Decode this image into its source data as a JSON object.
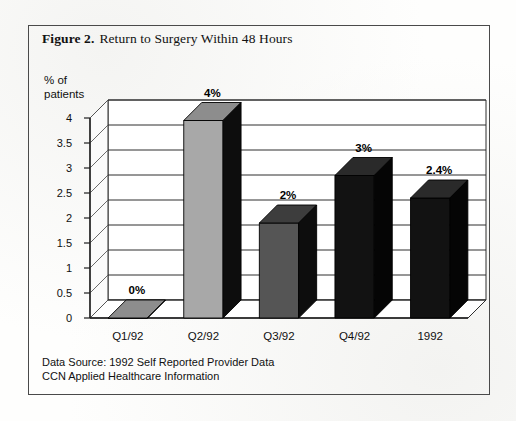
{
  "figure": {
    "caption_label": "Figure 2.",
    "caption_text": "Return to Surgery Within 48 Hours"
  },
  "source_note": "Data Source: 1992 Self Reported Provider Data\nCCN Applied Healthcare Information",
  "axis": {
    "y_title": "% of\npatients"
  },
  "colors": {
    "frame": "#4a4a4a",
    "text": "#111111",
    "gridline": "#2e2e2e",
    "bar_light": "#a8a8a8",
    "bar_mid": "#555555",
    "bar_dark": "#121212",
    "bar_side_dark": "#0d0d0d",
    "bar_top_light": "#8d8d8d",
    "bar_top_dark": "#2a2a2a",
    "plot_background": "#ffffff"
  },
  "chart_data": {
    "type": "bar",
    "title": "Return to Surgery Within 48 Hours",
    "xlabel": "",
    "ylabel": "% of patients",
    "ylim": [
      0,
      4
    ],
    "yticks": [
      0,
      0.5,
      1,
      1.5,
      2,
      2.5,
      3,
      3.5,
      4
    ],
    "ytick_labels": [
      "0",
      "0.5",
      "1",
      "1.5",
      "2",
      "2.5",
      "3",
      "3.5",
      "4"
    ],
    "grid": true,
    "legend": false,
    "three_d": true,
    "categories": [
      "Q1/92",
      "Q2/92",
      "Q3/92",
      "Q4/92",
      "1992"
    ],
    "values": [
      0,
      3.95,
      1.9,
      2.85,
      2.4
    ],
    "data_labels": [
      "0%",
      "4%",
      "2%",
      "3%",
      "2.4%"
    ],
    "bar_colors": [
      "#a8a8a8",
      "#a8a8a8",
      "#555555",
      "#121212",
      "#121212"
    ],
    "bars": [
      {
        "category": "Q1/92",
        "value": 0,
        "label": "0%",
        "front": "#a8a8a8",
        "top": "#8d8d8d",
        "side": "#0d0d0d"
      },
      {
        "category": "Q2/92",
        "value": 3.95,
        "label": "4%",
        "front": "#a8a8a8",
        "top": "#8d8d8d",
        "side": "#0d0d0d"
      },
      {
        "category": "Q3/92",
        "value": 1.9,
        "label": "2%",
        "front": "#555555",
        "top": "#3d3d3d",
        "side": "#0d0d0d"
      },
      {
        "category": "Q4/92",
        "value": 2.85,
        "label": "3%",
        "front": "#121212",
        "top": "#2a2a2a",
        "side": "#050505"
      },
      {
        "category": "1992",
        "value": 2.4,
        "label": "2.4%",
        "front": "#121212",
        "top": "#2a2a2a",
        "side": "#050505"
      }
    ]
  }
}
